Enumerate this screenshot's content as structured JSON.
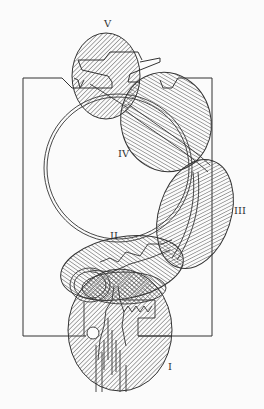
{
  "figure": {
    "type": "technical cross-section diagram with hatched detail regions",
    "colors": {
      "line": "#333333",
      "background": "#fbfbfb",
      "hatch": "#444444"
    },
    "regions": [
      {
        "id": "I",
        "label": "I"
      },
      {
        "id": "II",
        "label": "II"
      },
      {
        "id": "III",
        "label": "III"
      },
      {
        "id": "IV",
        "label": "IV"
      },
      {
        "id": "V",
        "label": "V"
      }
    ]
  }
}
